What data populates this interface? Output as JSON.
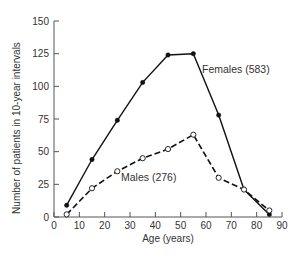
{
  "chart_data": {
    "type": "line",
    "title": "",
    "xlabel": "Age (years)",
    "ylabel": "Number of patients in 10-year intervals",
    "xlim": [
      0,
      90
    ],
    "ylim": [
      0,
      150
    ],
    "x_ticks": [
      0,
      10,
      20,
      30,
      40,
      50,
      60,
      70,
      80,
      90
    ],
    "y_ticks": [
      0,
      25,
      50,
      75,
      100,
      125,
      150
    ],
    "grid": false,
    "legend": "inline labels",
    "x": [
      5,
      15,
      25,
      35,
      45,
      55,
      65,
      75,
      85
    ],
    "series": [
      {
        "name": "Females (583)",
        "style": "solid line, filled circle markers",
        "values": [
          9,
          44,
          74,
          103,
          124,
          125,
          78,
          21,
          2
        ]
      },
      {
        "name": "Males (276)",
        "style": "dashed line, open circle markers",
        "values": [
          2,
          22,
          35,
          45,
          52,
          63,
          30,
          21,
          5
        ]
      }
    ]
  },
  "labels": {
    "xlabel": "Age (years)",
    "ylabel": "Number of patients in 10-year intervals",
    "females": "Females (583)",
    "males": "Males (276)"
  },
  "colors": {
    "line": "#111111",
    "text": "#333333",
    "axis": "#555555"
  }
}
